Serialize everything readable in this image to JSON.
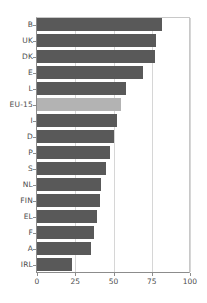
{
  "chart_data": {
    "type": "bar",
    "orientation": "horizontal",
    "title": "",
    "subtitle": "",
    "xlabel": "",
    "ylabel": "",
    "xlim": [
      0,
      100
    ],
    "xticks": [
      "0",
      "25",
      "50",
      "75",
      "100"
    ],
    "xtick_values": [
      0,
      25,
      50,
      75,
      100
    ],
    "grid": true,
    "grid_axis": "x",
    "legend": null,
    "categories": [
      "B",
      "UK",
      "DK",
      "E",
      "L",
      "EU-15",
      "I",
      "D",
      "P",
      "S",
      "NL",
      "FIN",
      "EL",
      "F",
      "A",
      "IRL"
    ],
    "values": [
      82,
      78,
      77,
      69,
      58,
      55,
      52,
      50,
      48,
      45,
      42,
      41,
      39,
      37,
      35,
      23
    ],
    "highlight_category": "EU-15",
    "series": [
      {
        "name": "value",
        "values": [
          82,
          78,
          77,
          69,
          58,
          55,
          52,
          50,
          48,
          45,
          42,
          41,
          39,
          37,
          35,
          23
        ]
      }
    ],
    "colors": {
      "bar": "#595959",
      "bar_highlight": "#b3b3b3",
      "axis": "#8c8c8c",
      "grid": "#d6d6d6",
      "text": "#4d4d4d",
      "background": "#ffffff"
    }
  }
}
